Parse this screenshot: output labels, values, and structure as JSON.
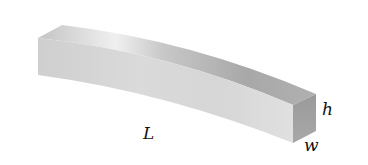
{
  "figure": {
    "labels": {
      "length": "L",
      "height": "h",
      "width": "w"
    },
    "colors": {
      "background": "#ffffff",
      "top_face": "#bdbdbd",
      "top_highlight": "#efefef",
      "front_face": "#d4d4d4",
      "end_face": "#9e9e9e",
      "text": "#111111"
    }
  }
}
